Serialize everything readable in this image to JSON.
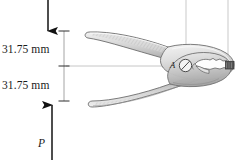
{
  "figure": {
    "background_color": "#ffffff"
  },
  "dimensions": [
    {
      "id": "upper",
      "value": "31.75 mm",
      "orientation": "vertical"
    },
    {
      "id": "lower",
      "value": "31.75 mm",
      "orientation": "vertical"
    }
  ],
  "forces": [
    {
      "id": "top-force",
      "label": "",
      "direction": "down",
      "arrow": "downward-arrow"
    },
    {
      "id": "bottom-force",
      "label": "P",
      "direction": "up",
      "arrow": "upward-arrow"
    }
  ],
  "annotations": [
    {
      "id": "pivot",
      "label": "A",
      "shape": "pin-circle"
    }
  ],
  "colors": {
    "ink": "#1a1a1a",
    "outline": "#6e6e6e",
    "metal_light": "#e8e8e8",
    "metal_mid": "#c9c9c9",
    "metal_dark": "#9a9a9a",
    "hatch": "#b0b0b0",
    "guide": "#c4c4c4",
    "centerline": "#bdbdbd",
    "block": "#5a5a5a"
  },
  "geometry": {
    "dimension_line_x": 64,
    "tick_y_top": 31,
    "tick_y_mid": 66,
    "tick_y_bottom": 100,
    "top_arrow_x": 48,
    "bottom_arrow_x": 52,
    "pivot_x": 185,
    "pivot_y": 65
  }
}
